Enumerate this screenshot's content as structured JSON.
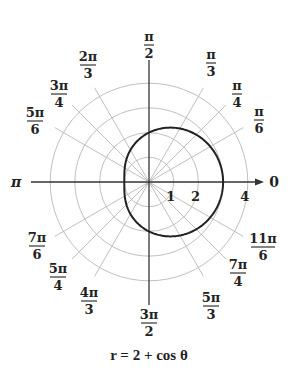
{
  "chart_data": {
    "type": "line",
    "subtype": "polar",
    "title": "",
    "caption": "r = 2 + cos θ",
    "equation": "r = 2 + cos(theta)",
    "center_px": [
      149,
      182
    ],
    "unit_px": 24.7,
    "circles_r": [
      1,
      2,
      3,
      4
    ],
    "radial_tick_labels": [
      {
        "text": "1",
        "r": 1
      },
      {
        "text": "2",
        "r": 2
      },
      {
        "text": "4",
        "r": 4
      }
    ],
    "angle_labels": [
      {
        "num": "",
        "den": "",
        "text": "0",
        "deg": 0,
        "x": 274,
        "y": 182
      },
      {
        "num": "π",
        "den": "6",
        "deg": 30,
        "x": 259,
        "y": 120
      },
      {
        "num": "π",
        "den": "4",
        "deg": 45,
        "x": 237,
        "y": 94
      },
      {
        "num": "π",
        "den": "3",
        "deg": 60,
        "x": 211,
        "y": 63
      },
      {
        "num": "π",
        "den": "2",
        "deg": 90,
        "x": 149,
        "y": 45
      },
      {
        "num": "2π",
        "den": "3",
        "deg": 120,
        "x": 88,
        "y": 65
      },
      {
        "num": "3π",
        "den": "4",
        "deg": 135,
        "x": 59,
        "y": 94
      },
      {
        "num": "5π",
        "den": "6",
        "deg": 150,
        "x": 35,
        "y": 121
      },
      {
        "num": "",
        "den": "",
        "text": "π",
        "deg": 180,
        "x": 16,
        "y": 182
      },
      {
        "num": "7π",
        "den": "6",
        "deg": 210,
        "x": 37,
        "y": 246
      },
      {
        "num": "5π",
        "den": "4",
        "deg": 225,
        "x": 58,
        "y": 277
      },
      {
        "num": "4π",
        "den": "3",
        "deg": 240,
        "x": 89,
        "y": 301
      },
      {
        "num": "3π",
        "den": "2",
        "deg": 270,
        "x": 149,
        "y": 323
      },
      {
        "num": "5π",
        "den": "3",
        "deg": 300,
        "x": 211,
        "y": 306
      },
      {
        "num": "7π",
        "den": "4",
        "deg": 315,
        "x": 238,
        "y": 273
      },
      {
        "num": "11π",
        "den": "6",
        "deg": 330,
        "x": 263,
        "y": 247
      }
    ],
    "spoke_angles_deg": [
      30,
      45,
      60,
      120,
      135,
      150,
      210,
      225,
      240,
      300,
      315,
      330
    ],
    "series": [
      {
        "name": "r = 2 + cos θ",
        "theta_deg": [
          0,
          30,
          60,
          90,
          120,
          150,
          180,
          210,
          240,
          270,
          300,
          330,
          360
        ],
        "r": [
          3,
          2.866,
          2.5,
          2,
          1.5,
          1.134,
          1,
          1.134,
          1.5,
          2,
          2.5,
          2.866,
          3
        ]
      }
    ],
    "rlim": [
      0,
      4
    ],
    "grid": true,
    "colors": {
      "curve": "#222222",
      "axis": "#333333",
      "grid": "#b8b8b8"
    }
  }
}
